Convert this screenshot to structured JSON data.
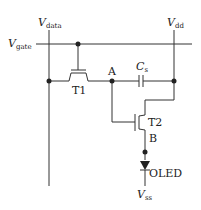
{
  "diagram": {
    "labels": {
      "vdata_main": "V",
      "vdata_sub": "data",
      "vdd_main": "V",
      "vdd_sub": "dd",
      "vgate_main": "V",
      "vgate_sub": "gate",
      "cs_main": "C",
      "cs_sub": "s",
      "node_a": "A",
      "node_b": "B",
      "t1": "T1",
      "t2": "T2",
      "oled": "OLED",
      "vss_main": "V",
      "vss_sub": "ss"
    },
    "components": [
      {
        "id": "T1",
        "type": "switching-transistor"
      },
      {
        "id": "T2",
        "type": "driving-transistor"
      },
      {
        "id": "Cs",
        "type": "storage-capacitor"
      },
      {
        "id": "OLED",
        "type": "diode"
      }
    ],
    "colors": {
      "line": "#333333",
      "background": "#ffffff"
    }
  }
}
